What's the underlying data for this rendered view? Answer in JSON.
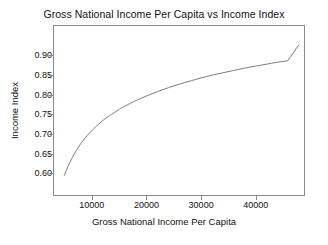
{
  "chart_data": {
    "type": "line",
    "title": "Gross National Income Per Capita vs Income Index",
    "xlabel": "Gross National Income Per Capita",
    "ylabel": "Income Index",
    "grid": false,
    "legend": "none",
    "xlim": [
      2900,
      49000
    ],
    "ylim": [
      0.543,
      0.976
    ],
    "xticks": [
      10000,
      20000,
      30000,
      40000
    ],
    "xtick_labels": [
      "10000",
      "20000",
      "30000",
      "40000"
    ],
    "yticks": [
      0.6,
      0.65,
      0.7,
      0.75,
      0.8,
      0.85,
      0.9
    ],
    "ytick_labels": [
      "0.60",
      "0.65",
      "0.70",
      "0.75",
      "0.80",
      "0.85",
      "0.90"
    ],
    "line_color": "#787878",
    "frame_color": "#8a8a8a",
    "background_color": "#ffffff",
    "series": [
      {
        "name": "Income Index",
        "x": [
          4800,
          5500,
          6200,
          7000,
          8000,
          9000,
          10000,
          11000,
          12000,
          13000,
          14000,
          15000,
          16000,
          17000,
          18000,
          19000,
          20000,
          22000,
          24000,
          26000,
          28000,
          30000,
          32000,
          34000,
          36000,
          38000,
          40000,
          42000,
          44000,
          46000,
          48000
        ],
        "y": [
          0.593,
          0.617,
          0.637,
          0.657,
          0.678,
          0.695,
          0.71,
          0.723,
          0.735,
          0.745,
          0.754,
          0.763,
          0.771,
          0.778,
          0.785,
          0.791,
          0.797,
          0.808,
          0.818,
          0.827,
          0.835,
          0.843,
          0.85,
          0.856,
          0.862,
          0.868,
          0.873,
          0.878,
          0.883,
          0.887,
          0.927
        ]
      }
    ]
  }
}
